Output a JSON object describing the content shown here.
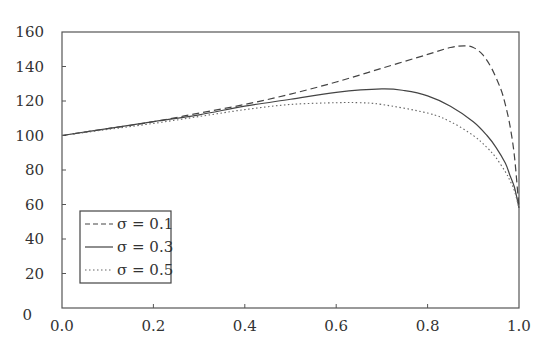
{
  "chart_data": {
    "type": "line",
    "title": "",
    "xlabel": "",
    "ylabel": "",
    "xlim": [
      0.0,
      1.0
    ],
    "ylim": [
      0,
      160
    ],
    "grid": false,
    "legend_position": "lower left",
    "x_ticks": [
      "0.0",
      "0.2",
      "0.4",
      "0.6",
      "0.8",
      "1.0"
    ],
    "y_ticks": [
      "0",
      "20",
      "40",
      "60",
      "80",
      "100",
      "120",
      "140",
      "160"
    ],
    "series": [
      {
        "name": "σ = 0.1",
        "style": "dashed",
        "x": [
          0.0,
          0.1,
          0.2,
          0.3,
          0.4,
          0.5,
          0.6,
          0.7,
          0.8,
          0.85,
          0.88,
          0.9,
          0.92,
          0.94,
          0.96,
          0.97,
          0.98,
          0.99,
          1.0
        ],
        "y": [
          100,
          104,
          108,
          113,
          118,
          124,
          131,
          139,
          147,
          151,
          152,
          151,
          147,
          139,
          127,
          118,
          106,
          88,
          58
        ]
      },
      {
        "name": "σ = 0.3",
        "style": "solid",
        "x": [
          0.0,
          0.1,
          0.2,
          0.3,
          0.4,
          0.5,
          0.6,
          0.7,
          0.75,
          0.8,
          0.85,
          0.9,
          0.93,
          0.95,
          0.97,
          0.98,
          0.99,
          1.0
        ],
        "y": [
          100,
          104,
          108,
          112,
          117,
          121,
          125,
          127,
          126,
          123,
          117,
          108,
          100,
          93,
          84,
          77,
          70,
          58
        ]
      },
      {
        "name": "σ = 0.5",
        "style": "dotted",
        "x": [
          0.0,
          0.1,
          0.2,
          0.3,
          0.4,
          0.5,
          0.6,
          0.65,
          0.7,
          0.8,
          0.85,
          0.9,
          0.93,
          0.95,
          0.97,
          0.98,
          0.99,
          1.0
        ],
        "y": [
          100,
          103.5,
          107,
          111,
          115,
          118,
          119,
          119,
          118,
          113,
          108,
          100,
          93,
          87,
          79,
          74,
          68,
          58
        ]
      }
    ]
  }
}
